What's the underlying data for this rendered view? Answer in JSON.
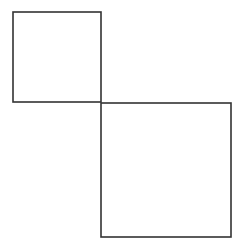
{
  "diagram": {
    "width": 246,
    "height": 248,
    "background": "#ffffff",
    "stroke_color": "#333333",
    "stroke_width": 1.6,
    "shapes": [
      {
        "id": "small-square",
        "type": "rect",
        "x": 13,
        "y": 12,
        "width": 88,
        "height": 90
      },
      {
        "id": "large-square",
        "type": "rect",
        "x": 101,
        "y": 103,
        "width": 130,
        "height": 134
      }
    ]
  }
}
